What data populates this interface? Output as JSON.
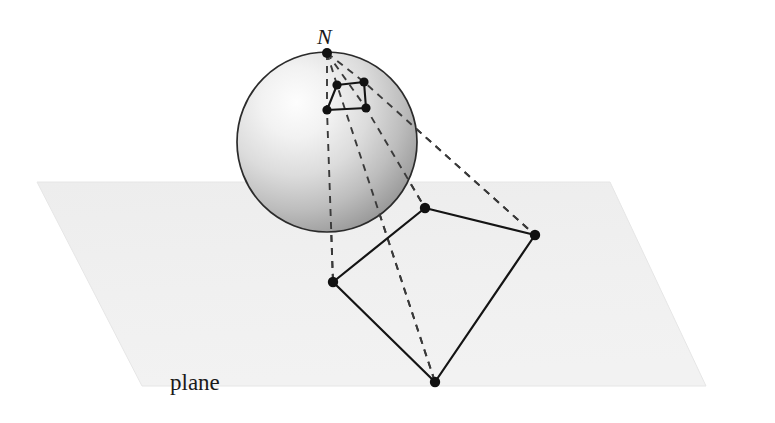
{
  "figure": {
    "background_color": "#ffffff",
    "width": 775,
    "height": 423,
    "labels": {
      "north_pole": "N",
      "plane": "plane"
    },
    "colors": {
      "plane_fill": "#efefef",
      "plane_edge": "#e4e4e4",
      "sphere_light": "#fbfbfb",
      "sphere_mid": "#d2d2d2",
      "sphere_dark": "#8a8a8a",
      "sphere_outline": "#2a2a2a",
      "solid_line": "#1a1a1a",
      "dashed_line": "#2a2a2a",
      "vertex_dot": "#111111",
      "label_text": "#1a1a1a"
    },
    "plane": {
      "shape": "parallelogram",
      "points": [
        [
          37,
          182
        ],
        [
          610,
          182
        ],
        [
          706,
          386
        ],
        [
          142,
          386
        ]
      ]
    },
    "sphere": {
      "center_x": 327,
      "center_y": 142,
      "radius": 90,
      "highlight_x": 275,
      "highlight_y": 105
    },
    "north_pole_point": [
      327,
      53
    ],
    "sphere_quad": {
      "name": "quadrilateral-on-sphere",
      "points": [
        [
          337,
          85
        ],
        [
          364,
          82
        ],
        [
          366,
          108
        ],
        [
          327,
          110
        ]
      ]
    },
    "plane_quad": {
      "name": "quadrilateral-on-plane",
      "points": [
        [
          425,
          208
        ],
        [
          535,
          235
        ],
        [
          435,
          382
        ],
        [
          333,
          282
        ]
      ]
    },
    "projection_rays": [
      {
        "name": "ray-to-left-vertex",
        "from": [
          327,
          53
        ],
        "through": [
          327,
          110
        ],
        "to": [
          333,
          282
        ]
      },
      {
        "name": "ray-to-top-vertex",
        "from": [
          327,
          53
        ],
        "through": [
          366,
          108
        ],
        "to": [
          425,
          208
        ]
      },
      {
        "name": "ray-to-right-vertex",
        "from": [
          327,
          53
        ],
        "through": [
          364,
          82
        ],
        "to": [
          535,
          235
        ]
      },
      {
        "name": "ray-to-bottom-vertex",
        "from": [
          327,
          53
        ],
        "through": [
          337,
          85
        ],
        "to": [
          435,
          382
        ]
      }
    ]
  }
}
